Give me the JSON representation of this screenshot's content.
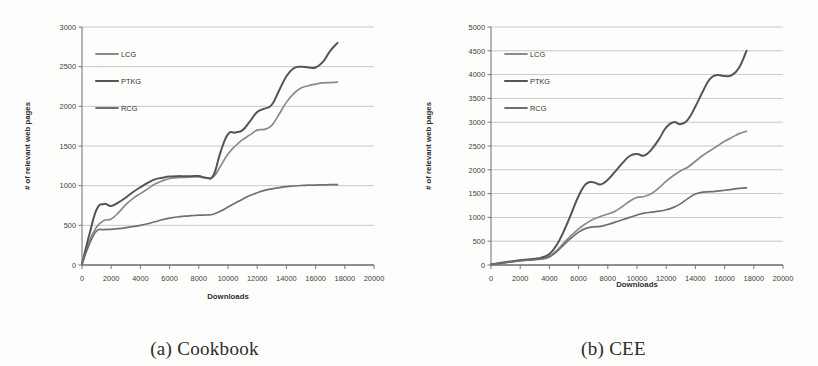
{
  "figure": {
    "panels": [
      {
        "caption": "(a) Cookbook",
        "legend": [
          "LCG",
          "PTKG",
          "RCG"
        ],
        "chart_data": {
          "type": "line",
          "title": "",
          "subtitle": "",
          "xlabel": "Downloads",
          "ylabel": "# of relevant web pages",
          "xlim": [
            0,
            20000
          ],
          "ylim": [
            0,
            3000
          ],
          "xticks": [
            0,
            2000,
            4000,
            6000,
            8000,
            10000,
            12000,
            14000,
            16000,
            18000,
            20000
          ],
          "yticks": [
            0,
            500,
            1000,
            1500,
            2000,
            2500,
            3000
          ],
          "xtick_labels": [
            "0",
            "2000",
            "4000",
            "6000",
            "8000",
            "10000",
            "12000",
            "14000",
            "16000",
            "18000",
            "20000"
          ],
          "ytick_labels": [
            "0",
            "500",
            "1000",
            "1500",
            "2000",
            "2500",
            "3000"
          ],
          "grid": "horizontal",
          "legend_position": "upper-left-inside",
          "x": [
            0,
            500,
            1000,
            1500,
            2000,
            2500,
            3000,
            3500,
            4000,
            4500,
            5000,
            5500,
            6000,
            6500,
            7000,
            7500,
            8000,
            8500,
            9000,
            9500,
            10000,
            10500,
            11000,
            11500,
            12000,
            12500,
            13000,
            13500,
            14000,
            14500,
            15000,
            15500,
            16000,
            16500,
            17000,
            17500
          ],
          "series": [
            {
              "name": "LCG",
              "color": "#8a8a8a",
              "values": [
                10,
                300,
                480,
                560,
                580,
                660,
                760,
                840,
                900,
                960,
                1020,
                1060,
                1090,
                1100,
                1105,
                1110,
                1110,
                1100,
                1110,
                1250,
                1400,
                1500,
                1580,
                1640,
                1700,
                1710,
                1760,
                1900,
                2050,
                2160,
                2230,
                2260,
                2280,
                2295,
                2300,
                2305
              ]
            },
            {
              "name": "PTKG",
              "color": "#555555",
              "values": [
                10,
                380,
                700,
                770,
                745,
                790,
                850,
                920,
                980,
                1035,
                1080,
                1100,
                1115,
                1120,
                1120,
                1120,
                1122,
                1100,
                1130,
                1430,
                1650,
                1670,
                1700,
                1810,
                1930,
                1970,
                2020,
                2200,
                2380,
                2480,
                2500,
                2490,
                2490,
                2560,
                2700,
                2800
              ]
            },
            {
              "name": "RCG",
              "color": "#6f6f6f",
              "values": [
                10,
                260,
                430,
                445,
                450,
                458,
                470,
                485,
                500,
                520,
                545,
                570,
                590,
                605,
                615,
                622,
                628,
                630,
                640,
                680,
                730,
                780,
                830,
                875,
                910,
                940,
                960,
                975,
                988,
                996,
                1002,
                1006,
                1008,
                1010,
                1012,
                1013
              ]
            }
          ]
        }
      },
      {
        "caption": "(b) CEE",
        "legend": [
          "LCG",
          "PTKG",
          "RCG"
        ],
        "chart_data": {
          "type": "line",
          "title": "",
          "subtitle": "",
          "xlabel": "Downloads",
          "ylabel": "# of relevant web pages",
          "xlim": [
            0,
            20000
          ],
          "ylim": [
            0,
            5000
          ],
          "xticks": [
            0,
            2000,
            4000,
            6000,
            8000,
            10000,
            12000,
            14000,
            16000,
            18000,
            20000
          ],
          "yticks": [
            0,
            500,
            1000,
            1500,
            2000,
            2500,
            3000,
            3500,
            4000,
            4500,
            5000
          ],
          "xtick_labels": [
            "0",
            "2000",
            "4000",
            "6000",
            "8000",
            "10000",
            "12000",
            "14000",
            "16000",
            "18000",
            "20000"
          ],
          "ytick_labels": [
            "0",
            "500",
            "1000",
            "1500",
            "2000",
            "2500",
            "3000",
            "3500",
            "4000",
            "4500",
            "5000"
          ],
          "grid": "horizontal",
          "legend_position": "upper-left-inside",
          "x": [
            0,
            500,
            1000,
            1500,
            2000,
            2500,
            3000,
            3500,
            4000,
            4500,
            5000,
            5500,
            6000,
            6500,
            7000,
            7500,
            8000,
            8500,
            9000,
            9500,
            10000,
            10500,
            11000,
            11500,
            12000,
            12500,
            13000,
            13500,
            14000,
            14500,
            15000,
            15500,
            16000,
            16500,
            17000,
            17500
          ],
          "series": [
            {
              "name": "LCG",
              "color": "#8a8a8a",
              "values": [
                10,
                30,
                55,
                75,
                95,
                110,
                120,
                140,
                185,
                300,
                470,
                620,
                760,
                870,
                960,
                1020,
                1070,
                1130,
                1230,
                1340,
                1420,
                1440,
                1500,
                1620,
                1760,
                1880,
                1980,
                2060,
                2180,
                2300,
                2400,
                2500,
                2600,
                2680,
                2760,
                2810
              ]
            },
            {
              "name": "PTKG",
              "color": "#555555",
              "values": [
                10,
                35,
                60,
                80,
                100,
                115,
                130,
                160,
                230,
                420,
                720,
                1080,
                1450,
                1700,
                1740,
                1690,
                1790,
                1960,
                2140,
                2290,
                2330,
                2300,
                2430,
                2640,
                2890,
                3000,
                2960,
                3060,
                3330,
                3640,
                3910,
                3990,
                3970,
                3990,
                4150,
                4500
              ]
            },
            {
              "name": "RCG",
              "color": "#6f6f6f",
              "values": [
                10,
                28,
                50,
                70,
                88,
                100,
                112,
                128,
                170,
                280,
                430,
                570,
                690,
                770,
                800,
                810,
                850,
                900,
                950,
                1000,
                1050,
                1090,
                1110,
                1130,
                1160,
                1210,
                1290,
                1400,
                1490,
                1530,
                1540,
                1550,
                1570,
                1590,
                1610,
                1620
              ]
            }
          ]
        }
      }
    ]
  }
}
